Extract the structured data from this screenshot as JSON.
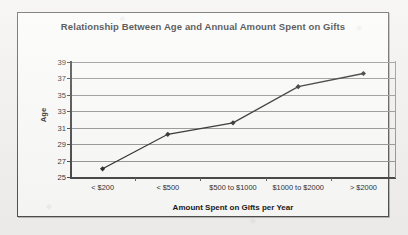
{
  "chart_data": {
    "type": "line",
    "title": "Relationship Between Age and Annual Amount Spent on Gifts",
    "xlabel": "Amount Spent on Gifts per Year",
    "ylabel": "Age",
    "categories": [
      "< $200",
      "< $500",
      "$500 to $1000",
      "$1000 to $2000",
      "> $2000"
    ],
    "values": [
      26,
      30.2,
      31.6,
      36,
      37.6
    ],
    "series": [
      {
        "name": "Age",
        "values": [
          26,
          30.2,
          31.6,
          36,
          37.6
        ]
      }
    ],
    "ylim": [
      25,
      39
    ],
    "ytick_labels": [
      "39",
      "37",
      "35",
      "33",
      "31",
      "29",
      "27",
      "25"
    ],
    "ytick_values": [
      39,
      37,
      35,
      33,
      31,
      29,
      27,
      25
    ],
    "grid": "horizontal",
    "legend": "none",
    "marker": "diamond",
    "line_color": "#1a1a1a",
    "grid_color": "#8d8d8d",
    "axis_color": "#3a3a3a",
    "background_color": "#fbfbfa"
  }
}
